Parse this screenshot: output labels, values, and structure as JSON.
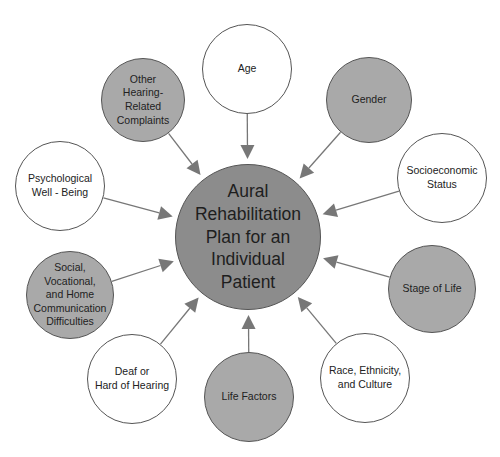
{
  "diagram": {
    "center": {
      "label": "Aural\nRehabilitation\nPlan for an\nIndividual\nPatient",
      "cx": 248,
      "cy": 237,
      "r": 73,
      "fill": "#8c8c8c"
    },
    "nodes": [
      {
        "id": "age",
        "label": "Age",
        "cx": 247,
        "cy": 69,
        "r": 45,
        "style": "white"
      },
      {
        "id": "gender",
        "label": "Gender",
        "cx": 369,
        "cy": 100,
        "r": 43,
        "style": "gray"
      },
      {
        "id": "socioeconomic",
        "label": "Socioeconomic\nStatus",
        "cx": 442,
        "cy": 178,
        "r": 45,
        "style": "white"
      },
      {
        "id": "stage-of-life",
        "label": "Stage of Life",
        "cx": 432,
        "cy": 289,
        "r": 44,
        "style": "gray"
      },
      {
        "id": "race",
        "label": "Race, Ethnicity,\nand Culture",
        "cx": 365,
        "cy": 378,
        "r": 45,
        "style": "white"
      },
      {
        "id": "life-factors",
        "label": "Life Factors",
        "cx": 249,
        "cy": 397,
        "r": 45,
        "style": "gray"
      },
      {
        "id": "deaf",
        "label": "Deaf or\nHard of Hearing",
        "cx": 132,
        "cy": 379,
        "r": 45,
        "style": "white"
      },
      {
        "id": "social",
        "label": "Social,\nVocational,\nand Home\nCommunication\nDifficulties",
        "cx": 70,
        "cy": 295,
        "r": 44,
        "style": "gray"
      },
      {
        "id": "psychological",
        "label": "Psychological\nWell - Being",
        "cx": 60,
        "cy": 186,
        "r": 45,
        "style": "white"
      },
      {
        "id": "other-hearing",
        "label": "Other\nHearing-\nRelated\nComplaints",
        "cx": 143,
        "cy": 100,
        "r": 42,
        "style": "gray"
      }
    ],
    "colors": {
      "white_fill": "#ffffff",
      "gray_fill": "#a9a9a9",
      "center_fill": "#8c8c8c",
      "arrow": "#777777",
      "outline": "#555555"
    }
  }
}
